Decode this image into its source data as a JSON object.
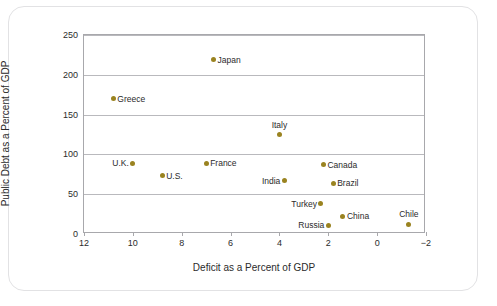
{
  "chart_data": {
    "type": "scatter",
    "title": "",
    "xlabel": "Deficit as a Percent of GDP",
    "ylabel": "Public Debt as a Percent of GDP",
    "xlim": [
      12,
      -2
    ],
    "ylim": [
      0,
      250
    ],
    "x_ticks": [
      "12",
      "10",
      "8",
      "6",
      "4",
      "2",
      "0",
      "−2"
    ],
    "x_tick_values": [
      12,
      10,
      8,
      6,
      4,
      2,
      0,
      -2
    ],
    "y_ticks": [
      "0",
      "50",
      "100",
      "150",
      "200",
      "250"
    ],
    "y_tick_values": [
      0,
      50,
      100,
      150,
      200,
      250
    ],
    "grid": "horizontal",
    "legend": "none",
    "marker_color": "#9a8320",
    "points": [
      {
        "label": "Japan",
        "x": 6.7,
        "y": 219,
        "label_pos": "right"
      },
      {
        "label": "Greece",
        "x": 10.8,
        "y": 170,
        "label_pos": "right"
      },
      {
        "label": "Italy",
        "x": 4.0,
        "y": 125,
        "label_pos": "above"
      },
      {
        "label": "U.K.",
        "x": 10.0,
        "y": 89,
        "label_pos": "left"
      },
      {
        "label": "France",
        "x": 7.0,
        "y": 89,
        "label_pos": "right"
      },
      {
        "label": "Canada",
        "x": 2.2,
        "y": 87,
        "label_pos": "right"
      },
      {
        "label": "U.S.",
        "x": 8.8,
        "y": 73,
        "label_pos": "right"
      },
      {
        "label": "India",
        "x": 3.8,
        "y": 67,
        "label_pos": "left"
      },
      {
        "label": "Brazil",
        "x": 1.8,
        "y": 64,
        "label_pos": "right"
      },
      {
        "label": "Turkey",
        "x": 2.3,
        "y": 38,
        "label_pos": "left"
      },
      {
        "label": "China",
        "x": 1.4,
        "y": 22,
        "label_pos": "right"
      },
      {
        "label": "Russia",
        "x": 2.0,
        "y": 11,
        "label_pos": "left"
      },
      {
        "label": "Chile",
        "x": -1.3,
        "y": 12,
        "label_pos": "above"
      }
    ]
  }
}
